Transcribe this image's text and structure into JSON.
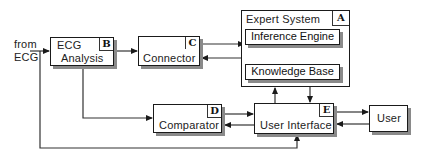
{
  "diagram": {
    "input_label_line1": "from",
    "input_label_line2": "ECG",
    "nodes": {
      "ecg_analysis": {
        "line1": "ECG",
        "line2": "Analysis",
        "tag": "B"
      },
      "connector": {
        "label": "Connector",
        "tag": "C"
      },
      "expert_system": {
        "label": "Expert System",
        "tag": "A",
        "children": {
          "inference_engine": "Inference Engine",
          "knowledge_base": "Knowledge Base"
        }
      },
      "comparator": {
        "label": "Comparator",
        "tag": "D"
      },
      "user_interface": {
        "label": "User Interface",
        "tag": "E"
      },
      "user": {
        "label": "User"
      }
    },
    "edges": [
      {
        "from": "ECG input",
        "to": "ECG Analysis"
      },
      {
        "from": "ECG Analysis",
        "to": "Connector"
      },
      {
        "from": "Connector",
        "to": "Inference Engine"
      },
      {
        "from": "Expert System",
        "to": "Connector"
      },
      {
        "from": "Knowledge Base",
        "to": "Inference Engine"
      },
      {
        "from": "Inference Engine",
        "to": "Knowledge Base"
      },
      {
        "from": "User Interface",
        "to": "Expert System"
      },
      {
        "from": "Expert System",
        "to": "User Interface"
      },
      {
        "from": "ECG Analysis",
        "to": "Comparator"
      },
      {
        "from": "Comparator",
        "to": "User Interface"
      },
      {
        "from": "User Interface",
        "to": "Comparator"
      },
      {
        "from": "User Interface",
        "to": "User"
      },
      {
        "from": "User",
        "to": "User Interface"
      },
      {
        "from": "ECG input",
        "to": "User Interface"
      }
    ]
  }
}
